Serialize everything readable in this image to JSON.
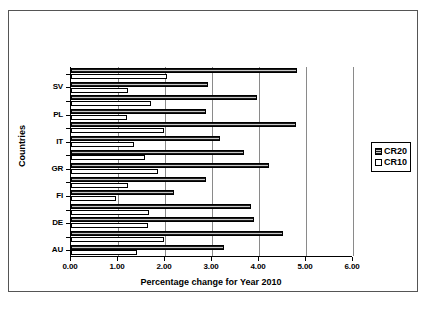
{
  "chart_data": {
    "type": "bar",
    "orientation": "horizontal",
    "title": "",
    "xlabel": "Percentage change for Year 2010",
    "ylabel": "Countries",
    "xlim": [
      0.0,
      6.0
    ],
    "xticks": [
      "0.00",
      "1.00",
      "2.00",
      "3.00",
      "4.00",
      "5.00",
      "6.00"
    ],
    "xtick_values": [
      0.0,
      1.0,
      2.0,
      3.0,
      4.0,
      5.0,
      6.0
    ],
    "grid": true,
    "grid_axis": "x",
    "legend_position": "right",
    "categories": [
      "",
      "SV",
      "PL",
      "",
      "IT",
      "",
      "GR",
      "",
      "FI",
      "",
      "DE",
      "",
      "AU",
      ""
    ],
    "visible_category_labels": [
      "SV",
      "PL",
      "IT",
      "GR",
      "FI",
      "DE",
      "AU"
    ],
    "groups": [
      {
        "label": "",
        "cr20": 4.8,
        "cr10": 2.05
      },
      {
        "label": "SV",
        "cr20": 2.92,
        "cr10": 1.22
      },
      {
        "label": "",
        "cr20": 3.95,
        "cr10": 1.7
      },
      {
        "label": "PL",
        "cr20": 2.87,
        "cr10": 1.2
      },
      {
        "label": "",
        "cr20": 4.78,
        "cr10": 1.97
      },
      {
        "label": "IT",
        "cr20": 3.17,
        "cr10": 1.33
      },
      {
        "label": "",
        "cr20": 3.68,
        "cr10": 1.58
      },
      {
        "label": "GR",
        "cr20": 4.22,
        "cr10": 1.85
      },
      {
        "label": "",
        "cr20": 2.88,
        "cr10": 1.22
      },
      {
        "label": "FI",
        "cr20": 2.2,
        "cr10": 0.95
      },
      {
        "label": "",
        "cr20": 3.82,
        "cr10": 1.65
      },
      {
        "label": "DE",
        "cr20": 3.9,
        "cr10": 1.63
      },
      {
        "label": "",
        "cr20": 4.5,
        "cr10": 1.97
      },
      {
        "label": "AU",
        "cr20": 3.25,
        "cr10": 1.4
      }
    ],
    "series": [
      {
        "name": "CR20",
        "values": [
          4.8,
          2.92,
          3.95,
          2.87,
          4.78,
          3.17,
          3.68,
          4.22,
          2.88,
          2.2,
          3.82,
          3.9,
          4.5,
          3.25
        ]
      },
      {
        "name": "CR10",
        "values": [
          2.05,
          1.22,
          1.7,
          1.2,
          1.97,
          1.33,
          1.58,
          1.85,
          1.22,
          0.95,
          1.65,
          1.63,
          1.97,
          1.4
        ]
      }
    ]
  },
  "legend": {
    "entries": [
      {
        "label": "CR20",
        "swatch": "hatched-dark"
      },
      {
        "label": "CR10",
        "swatch": "white"
      }
    ]
  },
  "colors": {
    "cr20_fill": "#5a5a5a",
    "cr20_hatch": "#1a1a1a",
    "cr10_fill": "#ffffff",
    "axis": "#000000",
    "gridline": "#8a8a8a",
    "frame": "#555555"
  }
}
